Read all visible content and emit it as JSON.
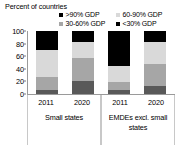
{
  "chart_data": {
    "type": "bar",
    "subtype": "stacked-bar-grouped",
    "title": "",
    "ylabel": "Percent of countries",
    "xlabel": "",
    "ylim": [
      0,
      100
    ],
    "yticks": [
      0,
      20,
      40,
      60,
      80,
      100
    ],
    "grid": false,
    "legend_position": "top",
    "categories": [
      "2011",
      "2020",
      "2011",
      "2020"
    ],
    "groups": [
      {
        "label": "Small states",
        "categories": [
          "2011",
          "2020"
        ]
      },
      {
        "label": "EMDEs excl. small states",
        "categories": [
          "2011",
          "2020"
        ]
      }
    ],
    "series": [
      {
        "name": "<30% GDP",
        "color": "#595959",
        "values": [
          7,
          20,
          7,
          13
        ]
      },
      {
        "name": "30-60% GDP",
        "color": "#a6a6a6",
        "values": [
          20,
          37,
          12,
          35
        ]
      },
      {
        "name": "60-90% GDP",
        "color": "#d9d9d9",
        "values": [
          43,
          25,
          26,
          34
        ]
      },
      {
        "name": ">90% GDP",
        "color": "#000000",
        "values": [
          30,
          18,
          55,
          18
        ]
      }
    ],
    "legend_order": [
      ">90% GDP",
      "60-90% GDP",
      "30-60% GDP",
      "<30% GDP"
    ]
  },
  "axis": {
    "title": "Percent of countries",
    "ytick_labels": [
      "100",
      "80",
      "60",
      "40",
      "20",
      "0"
    ]
  },
  "legend": {
    "rows": [
      [
        {
          "label": ">90% GDP",
          "color": "#000000"
        },
        {
          "label": "60-90% GDP",
          "color": "#d9d9d9"
        }
      ],
      [
        {
          "label": "30-60% GDP",
          "color": "#a6a6a6"
        },
        {
          "label": "<30% GDP",
          "color": "#000000"
        }
      ]
    ]
  },
  "xaxis": {
    "groups": [
      {
        "label": "Small states",
        "years": [
          "2011",
          "2020"
        ]
      },
      {
        "label": "EMDEs excl. small states",
        "years": [
          "2011",
          "2020"
        ]
      }
    ]
  }
}
